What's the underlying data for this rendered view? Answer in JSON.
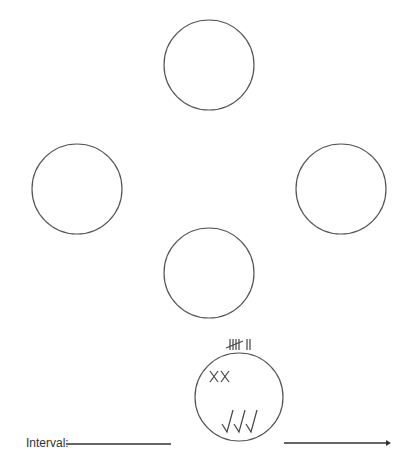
{
  "diagram": {
    "stroke_color": "#555555",
    "circles": [
      {
        "id": "top",
        "cx": 209,
        "cy": 65,
        "r": 45
      },
      {
        "id": "left",
        "cx": 77,
        "cy": 189,
        "r": 45
      },
      {
        "id": "right",
        "cx": 341,
        "cy": 189,
        "r": 45
      },
      {
        "id": "center",
        "cx": 209,
        "cy": 273,
        "r": 45
      },
      {
        "id": "bottom",
        "cx": 239,
        "cy": 397,
        "r": 44
      }
    ],
    "bottom_circle_marks": {
      "tally": "5 + 2 (7)",
      "crosses": "XX",
      "checks": "√√√"
    },
    "interval": {
      "label": "Interval:",
      "blank_line": true
    },
    "arrow": {
      "direction": "right"
    }
  }
}
